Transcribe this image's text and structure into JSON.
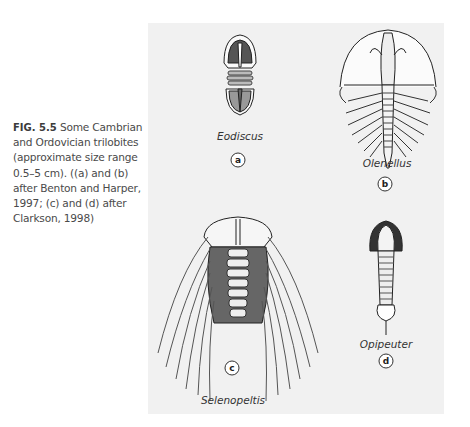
{
  "caption": {
    "figure_number": "FIG. 5.5",
    "text": "Some Cambrian and Ordovician trilobites (approximate size range 0.5–5 cm). ((a) and (b) after Benton and Harper, 1997; (c) and (d) after Clarkson, 1998)"
  },
  "figure": {
    "panels": [
      {
        "label": "a",
        "name": "Eodiscus"
      },
      {
        "label": "b",
        "name": "Olenellus"
      },
      {
        "label": "c",
        "name": "Selenopeltis"
      },
      {
        "label": "d",
        "name": "Opipeuter"
      }
    ]
  }
}
